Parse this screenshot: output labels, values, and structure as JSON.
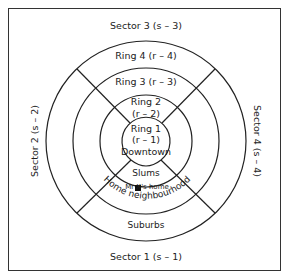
{
  "diagram": {
    "sectors": {
      "top": "Sector 3 (s – 3)",
      "left": "Sector 2 (s – 2)",
      "right": "Sector 4 (s – 4)",
      "bottom": "Sector 1 (s – 1)"
    },
    "rings": {
      "ring4": "Ring 4 (r – 4)",
      "ring3": "Ring 3 (r – 3)",
      "ring2_line1": "Ring 2",
      "ring2_line2": "(r – 2)",
      "ring1_line1": "Ring 1",
      "ring1_line2": "(r – 1)"
    },
    "zones": {
      "downtown": "Downtown",
      "slums": "Slums",
      "home": "Mr  X's home",
      "neighbourhood": "Home neighbourhood",
      "suburbs": "Suburbs"
    },
    "colors": {
      "line": "#222222",
      "background": "#ffffff"
    }
  }
}
